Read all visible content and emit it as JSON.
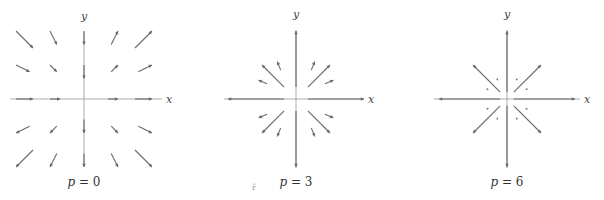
{
  "figure": {
    "stray_mark": "r̂",
    "panels": [
      {
        "id": "p0",
        "caption_var": "p",
        "caption_eq": " = ",
        "caption_val": "0",
        "x_label": "x",
        "y_label": "y",
        "origin": [
          84,
          99
        ],
        "x_axis": [
          10,
          162
        ],
        "y_axis": [
          32,
          167
        ],
        "unit_px": 34,
        "arrows": [
          [
            -2.0,
            2.0,
            -1.5,
            1.5,
            true
          ],
          [
            -1.0,
            2.0,
            -0.8,
            1.6,
            true
          ],
          [
            0,
            2.0,
            0,
            1.6,
            true
          ],
          [
            0.8,
            1.6,
            1.0,
            2.0,
            true
          ],
          [
            1.5,
            1.5,
            2.0,
            2.0,
            true
          ],
          [
            -2.0,
            1.0,
            -1.6,
            0.8,
            true
          ],
          [
            -1.0,
            1.0,
            -0.8,
            0.8,
            true
          ],
          [
            0,
            1.0,
            0,
            0.6,
            true
          ],
          [
            0.8,
            0.8,
            1.0,
            1.0,
            true
          ],
          [
            1.6,
            0.8,
            2.0,
            1.0,
            true
          ],
          [
            -2.0,
            0,
            -1.5,
            0,
            true
          ],
          [
            -1.0,
            0,
            -0.7,
            0,
            true
          ],
          [
            0.7,
            0,
            1.0,
            0,
            true
          ],
          [
            1.5,
            0,
            2.0,
            0,
            true
          ],
          [
            -1.6,
            -0.8,
            -2.0,
            -1.0,
            true
          ],
          [
            -0.8,
            -0.8,
            -1.0,
            -1.0,
            true
          ],
          [
            0,
            -0.6,
            0,
            -1.0,
            true
          ],
          [
            0.8,
            -0.8,
            1.0,
            -1.0,
            true
          ],
          [
            1.6,
            -0.8,
            2.0,
            -1.0,
            true
          ],
          [
            -1.5,
            -1.5,
            -2.0,
            -2.0,
            true
          ],
          [
            -0.8,
            -1.6,
            -1.0,
            -2.0,
            true
          ],
          [
            0,
            -1.6,
            0,
            -2.0,
            true
          ],
          [
            0.8,
            -1.6,
            1.0,
            -2.0,
            true
          ],
          [
            1.5,
            -1.5,
            2.0,
            -2.0,
            true
          ]
        ]
      },
      {
        "id": "p3",
        "caption_var": "p",
        "caption_eq": " = ",
        "caption_val": "3",
        "x_label": "x",
        "y_label": "y",
        "origin": [
          296,
          99
        ],
        "x_axis": [
          224,
          364
        ],
        "y_axis": [
          30,
          168
        ],
        "unit_px": 34,
        "arrows": [
          [
            0,
            0.35,
            0,
            2.0,
            true
          ],
          [
            0,
            -0.35,
            0,
            -2.0,
            true
          ],
          [
            0.35,
            0,
            2.0,
            0,
            true
          ],
          [
            -0.35,
            0,
            -2.0,
            0,
            true
          ],
          [
            0.35,
            0.35,
            1.0,
            1.0,
            true
          ],
          [
            -0.35,
            0.35,
            -1.0,
            1.0,
            true
          ],
          [
            0.35,
            -0.35,
            1.0,
            -1.0,
            true
          ],
          [
            -0.35,
            -0.35,
            -1.0,
            -1.0,
            true
          ],
          [
            0.45,
            0.85,
            0.55,
            1.1,
            true
          ],
          [
            -0.45,
            0.85,
            -0.55,
            1.1,
            true
          ],
          [
            0.45,
            -0.85,
            0.55,
            -1.1,
            true
          ],
          [
            -0.45,
            -0.85,
            -0.55,
            -1.1,
            true
          ],
          [
            0.85,
            0.45,
            1.1,
            0.55,
            true
          ],
          [
            -0.85,
            0.45,
            -1.1,
            0.55,
            true
          ],
          [
            0.85,
            -0.45,
            1.1,
            -0.55,
            true
          ],
          [
            -0.85,
            -0.45,
            -1.1,
            -0.55,
            true
          ]
        ]
      },
      {
        "id": "p6",
        "caption_var": "p",
        "caption_eq": " = ",
        "caption_val": "6",
        "x_label": "x",
        "y_label": "y",
        "origin": [
          507,
          99
        ],
        "x_axis": [
          434,
          580
        ],
        "y_axis": [
          30,
          168
        ],
        "unit_px": 34,
        "arrows": [
          [
            0,
            0.2,
            0,
            2.0,
            true
          ],
          [
            0,
            -0.2,
            0,
            -2.0,
            true
          ],
          [
            0.2,
            0,
            2.0,
            0,
            true
          ],
          [
            -0.2,
            0,
            -2.0,
            0,
            true
          ],
          [
            0.2,
            0.2,
            1.0,
            1.0,
            true
          ],
          [
            -0.2,
            0.2,
            -1.0,
            1.0,
            true
          ],
          [
            0.2,
            -0.2,
            1.0,
            -1.0,
            true
          ],
          [
            -0.2,
            -0.2,
            -1.0,
            -1.0,
            true
          ],
          [
            0.27,
            0.55,
            0.3,
            0.6,
            true
          ],
          [
            -0.27,
            0.55,
            -0.3,
            0.6,
            true
          ],
          [
            0.27,
            -0.55,
            0.3,
            -0.6,
            true
          ],
          [
            -0.27,
            -0.55,
            -0.3,
            -0.6,
            true
          ],
          [
            0.55,
            0.27,
            0.6,
            0.3,
            true
          ],
          [
            -0.55,
            0.27,
            -0.6,
            0.3,
            true
          ],
          [
            0.55,
            -0.27,
            0.6,
            -0.3,
            true
          ],
          [
            -0.55,
            -0.27,
            -0.6,
            -0.3,
            true
          ]
        ]
      }
    ]
  }
}
